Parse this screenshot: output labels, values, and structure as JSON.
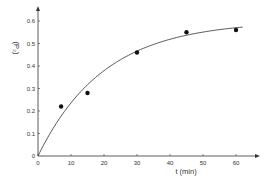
{
  "chart_data": {
    "type": "scatter",
    "title": "",
    "xlabel": "t (min)",
    "ylabel": "(P₂)",
    "xlim": [
      0,
      65
    ],
    "ylim": [
      0,
      0.65
    ],
    "x_ticks": [
      "0",
      "10",
      "20",
      "30",
      "40",
      "50",
      "60"
    ],
    "y_ticks": [
      "0",
      "0.1",
      "0.2",
      "0.3",
      "0.4",
      "0.5",
      "0.6"
    ],
    "grid": false,
    "legend": null,
    "series": [
      {
        "name": "measured",
        "kind": "points",
        "x": [
          7,
          15,
          30,
          45,
          60
        ],
        "y": [
          0.22,
          0.28,
          0.46,
          0.55,
          0.56
        ]
      },
      {
        "name": "fitted curve",
        "kind": "line",
        "model": "y = 0.6 * (1 - exp(-t/20))",
        "x": [
          0,
          5,
          10,
          15,
          20,
          25,
          30,
          35,
          40,
          45,
          50,
          55,
          62
        ],
        "y": [
          0,
          0.133,
          0.236,
          0.317,
          0.379,
          0.428,
          0.466,
          0.496,
          0.519,
          0.536,
          0.551,
          0.561,
          0.573
        ]
      }
    ]
  }
}
